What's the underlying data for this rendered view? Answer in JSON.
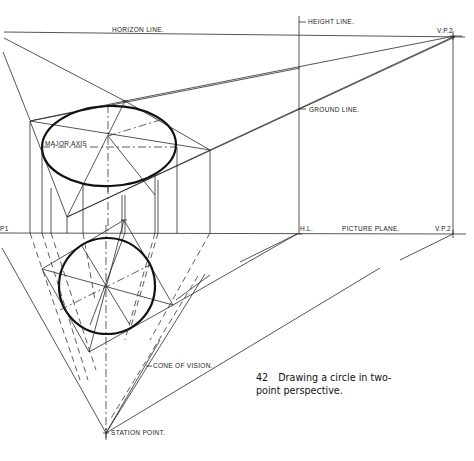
{
  "labels": {
    "horizon_line": "HORIZON LINE.",
    "height_line": "HEIGHT LINE.",
    "vp2_top": "V.P.2",
    "ground_line": "GROUND LINE.",
    "major_axis": "MAJOR AXIS",
    "vp1_left": "P1",
    "hl": "H.L.",
    "picture_plane": "PICTURE PLANE.",
    "vp2_bottom": "V.P.2",
    "cone_of_vision": "CONE OF VISION.",
    "station_point": "STATION POINT."
  },
  "caption": {
    "number": "42",
    "text_line1": "Drawing a circle in two-",
    "text_line2": "point perspective."
  },
  "colors": {
    "line": "#2a2a2a",
    "background": "#ffffff"
  }
}
